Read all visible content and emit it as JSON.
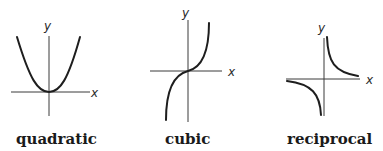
{
  "graphs": [
    {
      "name": "quadratic",
      "caption": "quadratic",
      "x_label": "x",
      "y_label": "y"
    },
    {
      "name": "cubic",
      "caption": "cubic",
      "x_label": "x",
      "y_label": "y"
    },
    {
      "name": "reciprocal",
      "caption": "reciprocal",
      "x_label": "x",
      "y_label": "y"
    }
  ],
  "colors": {
    "curve": "#1e1e1e",
    "axis": "#3a3a3a",
    "background": "#ffffff"
  }
}
